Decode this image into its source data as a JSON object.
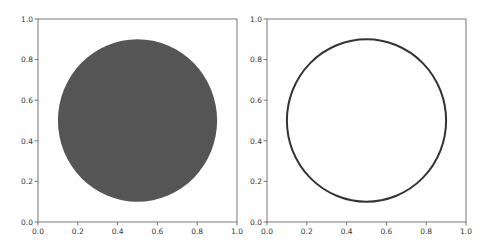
{
  "figure": {
    "background": "#ffffff"
  },
  "chart_data": [
    {
      "type": "scatter",
      "title": "",
      "xlabel": "",
      "ylabel": "",
      "xlim": [
        0.0,
        1.0
      ],
      "ylim": [
        0.0,
        1.0
      ],
      "grid": false,
      "x_ticks": [
        "0.0",
        "0.2",
        "0.4",
        "0.6",
        "0.8",
        "1.0"
      ],
      "y_ticks": [
        "0.0",
        "0.2",
        "0.4",
        "0.6",
        "0.8",
        "1.0"
      ],
      "shapes": [
        {
          "shape": "circle",
          "center": [
            0.5,
            0.5
          ],
          "radius": 0.4,
          "fill": true,
          "color": "#555555"
        }
      ]
    },
    {
      "type": "scatter",
      "title": "",
      "xlabel": "",
      "ylabel": "",
      "xlim": [
        0.0,
        1.0
      ],
      "ylim": [
        0.0,
        1.0
      ],
      "grid": false,
      "x_ticks": [
        "0.0",
        "0.2",
        "0.4",
        "0.6",
        "0.8",
        "1.0"
      ],
      "y_ticks": [
        "0.0",
        "0.2",
        "0.4",
        "0.6",
        "0.8",
        "1.0"
      ],
      "shapes": [
        {
          "shape": "circle",
          "center": [
            0.5,
            0.5
          ],
          "radius": 0.4,
          "fill": false,
          "color": "#333333",
          "linewidth": 2
        }
      ]
    }
  ]
}
